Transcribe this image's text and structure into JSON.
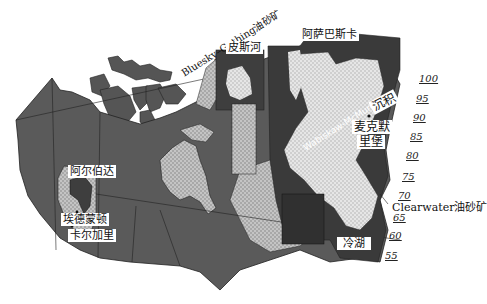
{
  "map": {
    "title": "Canada oil sands deposits (overview map)",
    "colors": {
      "land_dark": "#4a4a4a",
      "land_mid": "#6b6b6b",
      "deposit_light": "#b8b8b8",
      "deposit_highlight": "#d6d6d6",
      "water": "#ffffff",
      "border": "#222222"
    },
    "labels": {
      "bluesky": "Bluesky–Gething油砂矿",
      "peace_river": "皮斯河",
      "athabasca": "阿萨巴斯卡",
      "wabiskaw": "Wabiskaw-McMurray",
      "deposit": "沉积",
      "fort_mcmurray": "麦克默",
      "fort_mcmurray_2": "里堡",
      "clearwater": "Clearwater油砂矿",
      "cold_lake": "冷湖",
      "alberta": "阿尔伯达",
      "edmonton": "埃德蒙顿",
      "calgary": "卡尔加里"
    },
    "scale_ticks": [
      "100",
      "95",
      "90",
      "85",
      "80",
      "75",
      "70",
      "65",
      "60",
      "55"
    ]
  }
}
